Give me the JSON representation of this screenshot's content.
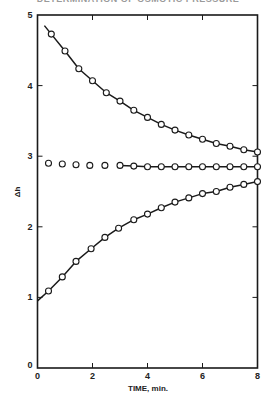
{
  "header": {
    "clipped_title": "DETERMINATION OF OSMOTIC PRESSURE"
  },
  "chart_data": {
    "type": "line",
    "title": "",
    "xlabel": "TIME, min.",
    "ylabel": "Δh",
    "xlim": [
      0,
      8
    ],
    "ylim": [
      0,
      5
    ],
    "x_ticks": [
      0,
      2,
      4,
      6,
      8
    ],
    "x_tick_labels": [
      "0",
      "2",
      "4",
      "6",
      "8"
    ],
    "y_ticks": [
      0,
      1,
      2,
      3,
      4,
      5
    ],
    "y_tick_labels": [
      "0",
      "1",
      "2",
      "3",
      "4",
      "5"
    ],
    "grid": false,
    "legend": null,
    "marker": "open-circle",
    "series": [
      {
        "name": "upper (descending)",
        "curve_start": [
          0.25,
          4.85
        ],
        "x": [
          0.5,
          1.0,
          1.5,
          2.0,
          2.5,
          3.0,
          3.5,
          4.0,
          4.5,
          5.0,
          5.5,
          6.0,
          6.5,
          7.0,
          7.5,
          8.0
        ],
        "y": [
          4.73,
          4.49,
          4.24,
          4.07,
          3.9,
          3.78,
          3.65,
          3.55,
          3.45,
          3.37,
          3.3,
          3.24,
          3.18,
          3.14,
          3.09,
          3.06
        ],
        "line": true
      },
      {
        "name": "middle (constant)",
        "x": [
          0.4,
          0.9,
          1.4,
          1.9,
          2.45,
          3.0,
          3.5,
          4.0,
          4.5,
          5.0,
          5.5,
          6.0,
          6.5,
          7.0,
          7.5,
          8.0
        ],
        "y": [
          2.9,
          2.89,
          2.88,
          2.87,
          2.87,
          2.87,
          2.86,
          2.85,
          2.85,
          2.85,
          2.85,
          2.85,
          2.85,
          2.85,
          2.85,
          2.85
        ],
        "line_from_x": 3.0,
        "line": true
      },
      {
        "name": "lower (ascending)",
        "curve_start": [
          0.0,
          0.95
        ],
        "x": [
          0.4,
          0.9,
          1.4,
          1.95,
          2.45,
          2.95,
          3.5,
          4.0,
          4.5,
          5.0,
          5.5,
          6.0,
          6.5,
          7.0,
          7.5,
          8.0
        ],
        "y": [
          1.09,
          1.29,
          1.51,
          1.69,
          1.85,
          1.98,
          2.1,
          2.18,
          2.27,
          2.35,
          2.41,
          2.47,
          2.5,
          2.56,
          2.6,
          2.64
        ],
        "line": true
      }
    ]
  },
  "colors": {
    "ink": "#1a1a1a",
    "background": "#ffffff"
  }
}
